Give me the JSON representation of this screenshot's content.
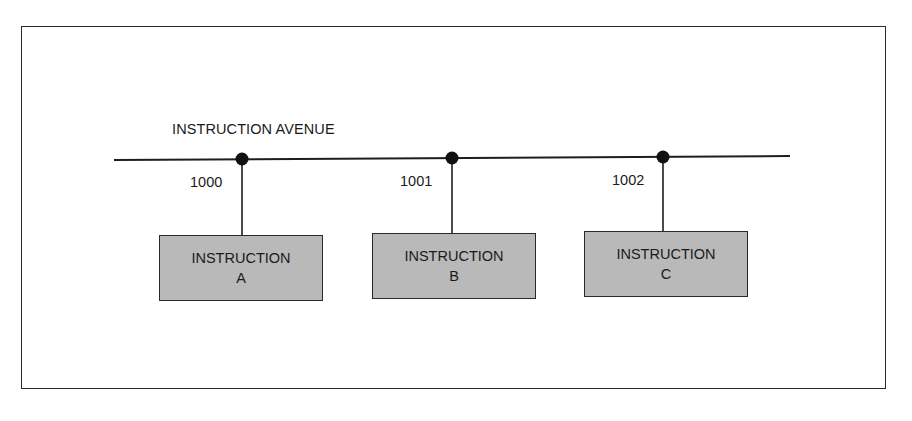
{
  "diagram": {
    "bus_label": "INSTRUCTION AVENUE",
    "nodes": [
      {
        "address": "1000",
        "title": "INSTRUCTION",
        "letter": "A"
      },
      {
        "address": "1001",
        "title": "INSTRUCTION",
        "letter": "B"
      },
      {
        "address": "1002",
        "title": "INSTRUCTION",
        "letter": "C"
      }
    ],
    "colors": {
      "line": "#1e1e1e",
      "box_fill": "#b9b9b9",
      "background": "#ffffff"
    }
  }
}
